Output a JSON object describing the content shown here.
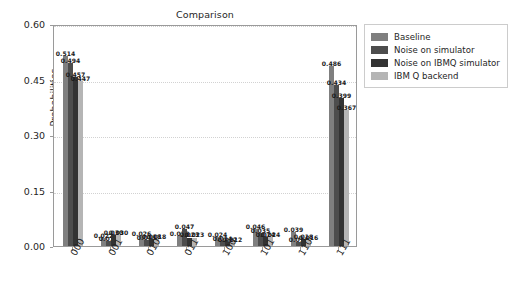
{
  "chart_data": {
    "type": "bar",
    "title": "Comparison",
    "xlabel": "",
    "ylabel": "Probabilities",
    "ylim": [
      0.0,
      0.6
    ],
    "yticks": [
      "0.00",
      "0.15",
      "0.30",
      "0.45",
      "0.60"
    ],
    "ytick_values": [
      0.0,
      0.15,
      0.3,
      0.45,
      0.6
    ],
    "grid": true,
    "legend_position": "upper right",
    "categories": [
      "000",
      "001",
      "010",
      "011",
      "100",
      "101",
      "110",
      "111"
    ],
    "series": [
      {
        "name": "Baseline",
        "color": "#7f7f7f",
        "values": [
          0.514,
          0.022,
          0.026,
          0.028,
          0.024,
          0.046,
          0.039,
          0.486
        ],
        "labels": [
          "0.514",
          "0.022",
          "0.026",
          "0.028",
          "0.024",
          "0.046",
          "0.039",
          "0.486"
        ]
      },
      {
        "name": "Noise on simulator",
        "color": "#4d4d4d",
        "values": [
          0.494,
          0.014,
          0.015,
          0.047,
          0.014,
          0.035,
          0.011,
          0.434
        ],
        "labels": [
          "0.494",
          "0.014",
          "0.015",
          "0.047",
          "0.014",
          "0.035",
          "0.011",
          "0.434"
        ]
      },
      {
        "name": "Noise on IBMQ simulator",
        "color": "#333333",
        "values": [
          0.457,
          0.03,
          0.018,
          0.023,
          0.012,
          0.024,
          0.018,
          0.399
        ],
        "labels": [
          "0.457",
          "0.030",
          "0.018",
          "0.023",
          "0.012",
          "0.024",
          "0.018",
          "0.399"
        ]
      },
      {
        "name": "IBM Q backend",
        "color": "#b5b5b5",
        "values": [
          0.447,
          0.03,
          0.018,
          0.023,
          0.012,
          0.024,
          0.016,
          0.367
        ],
        "labels": [
          "0.447",
          "0.030",
          "0.018",
          "0.023",
          "0.012",
          "0.024",
          "0.016",
          "0.367"
        ]
      }
    ]
  },
  "colors": {
    "axis": "#9a9a9a",
    "grid": "#d2d2d2",
    "text": "#262626",
    "background": "#ffffff"
  }
}
